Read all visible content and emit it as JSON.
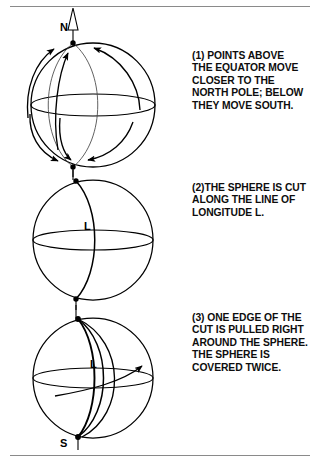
{
  "figure": {
    "background_color": "#ffffff",
    "ink_color": "#111111",
    "rule_color": "#8a8a8a",
    "rules": {
      "top_label": "top-divider-rule",
      "bottom_label": "bottom-divider-rule"
    }
  },
  "captions": {
    "step1": "(1) POINTS ABOVE\nTHE EQUATOR MOVE\nCLOSER TO THE\nNORTH POLE; BELOW\nTHEY MOVE SOUTH.",
    "step2": "(2)THE SPHERE IS CUT\nALONG THE LINE OF\nLONGITUDE L.",
    "step3": "(3) ONE EDGE OF THE\nCUT IS PULLED RIGHT\nAROUND THE SPHERE.\nTHE SPHERE IS\nCOVERED TWICE."
  },
  "labels": {
    "north_pole": "N",
    "south_pole": "S",
    "longitude_sphere2": "L",
    "longitude_sphere3": "L"
  },
  "spheres": [
    {
      "id": "sphere-1",
      "caption_ref": "step1",
      "center": [
        93,
        105
      ],
      "radius": 62,
      "has_equator": true,
      "has_flow_arrows": true,
      "arrow_count": 6,
      "description": "Sphere with meridian flow arrows converging on both poles"
    },
    {
      "id": "sphere-2",
      "caption_ref": "step2",
      "center": [
        93,
        240
      ],
      "radius": 60,
      "has_equator": true,
      "has_cut_line": true,
      "description": "Sphere cut along line of longitude L"
    },
    {
      "id": "sphere-3",
      "caption_ref": "step3",
      "center": [
        93,
        378
      ],
      "radius": 60,
      "has_equator": true,
      "has_cut_line": true,
      "has_drag_arrow": true,
      "description": "Sphere with one cut edge pulled around, covering the sphere twice"
    }
  ],
  "axis": {
    "name": "polar-axis",
    "top_arrow": "open-triangle-arrowhead",
    "orientation": "vertical"
  }
}
